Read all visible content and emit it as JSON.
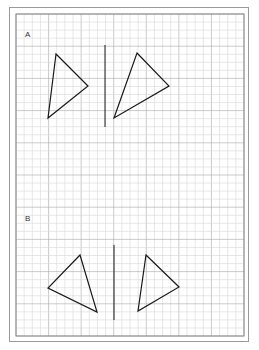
{
  "worksheet": {
    "colors": {
      "grid_minor": "#d6d6d6",
      "grid_major": "#a8a8a8",
      "ink": "#1a1a1a",
      "border": "#9a9a9a"
    },
    "grid": {
      "left": 16,
      "top": 14,
      "right": 244,
      "bottom": 336,
      "cell": 8.14,
      "major_every": 4
    },
    "sections": [
      {
        "label": "A",
        "label_pos": [
          28,
          35
        ],
        "mirror_line": {
          "x": 105,
          "y1": 45,
          "y2": 127
        },
        "shapes": [
          {
            "name": "triangle-a-original",
            "points": [
              [
                56,
                54
              ],
              [
                88,
                86
              ],
              [
                48,
                118
              ]
            ]
          },
          {
            "name": "triangle-a-image",
            "points": [
              [
                137,
                53
              ],
              [
                169,
                86
              ],
              [
                114,
                118
              ]
            ]
          }
        ]
      },
      {
        "label": "B",
        "label_pos": [
          28,
          219
        ],
        "mirror_line": {
          "x": 114,
          "y1": 245,
          "y2": 320
        },
        "shapes": [
          {
            "name": "triangle-b-original",
            "points": [
              [
                80,
                255
              ],
              [
                97,
                312
              ],
              [
                48,
                288
              ]
            ]
          },
          {
            "name": "triangle-b-image",
            "points": [
              [
                146,
                255
              ],
              [
                179,
                287
              ],
              [
                138,
                311
              ]
            ]
          }
        ]
      }
    ]
  }
}
